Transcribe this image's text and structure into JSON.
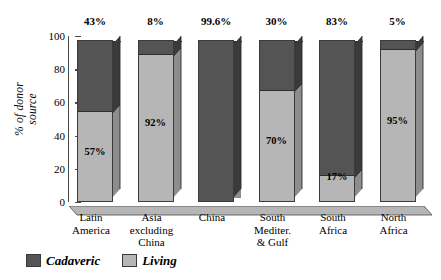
{
  "chart_data": {
    "type": "bar",
    "subtype": "stacked-100-3d",
    "title": "",
    "xlabel": "",
    "ylabel": "% of donor source",
    "ylabel_lines": [
      "% of donor",
      "source"
    ],
    "ylim": [
      0,
      100
    ],
    "yticks": [
      0,
      20,
      40,
      60,
      80,
      100
    ],
    "ytick_labels": [
      "0",
      "20",
      "40",
      "60",
      "80",
      "100"
    ],
    "grid": false,
    "legend_position": "bottom-left",
    "categories": [
      {
        "lines": [
          "Latin",
          "America"
        ]
      },
      {
        "lines": [
          "Asia",
          "excluding",
          "China"
        ]
      },
      {
        "lines": [
          "China"
        ]
      },
      {
        "lines": [
          "South",
          "Mediter.",
          "& Gulf"
        ]
      },
      {
        "lines": [
          "South",
          "Africa"
        ]
      },
      {
        "lines": [
          "North",
          "Africa"
        ]
      }
    ],
    "series": [
      {
        "name": "Cadaveric",
        "color": "#545454",
        "side_color": "#3a3a3a",
        "top_color": "#2f2f2f",
        "values": [
          43,
          8,
          99.6,
          30,
          83,
          5
        ],
        "top_labels": [
          "43%",
          "8%",
          "99.6%",
          "30%",
          "83%",
          "5%"
        ]
      },
      {
        "name": "Living",
        "color": "#b6b6b6",
        "side_color": "#8d8d8d",
        "top_color": "#9c9c9c",
        "values": [
          57,
          92,
          0.4,
          70,
          17,
          95
        ],
        "inner_labels": [
          "57%",
          "92%",
          "",
          "70%",
          "17%",
          "95%"
        ]
      }
    ],
    "legend": [
      {
        "label": "Cadaveric",
        "color": "#545454"
      },
      {
        "label": "Living",
        "color": "#b6b6b6"
      }
    ]
  }
}
